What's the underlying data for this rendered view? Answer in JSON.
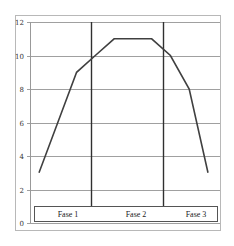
{
  "chart_data": {
    "type": "line",
    "title": "",
    "xlabel": "",
    "ylabel": "",
    "ylim": [
      0,
      12
    ],
    "yticks": [
      0,
      2,
      4,
      6,
      8,
      10,
      12
    ],
    "grid": "horizontal",
    "x": [
      1,
      2,
      3,
      4,
      5,
      6,
      7,
      8,
      9,
      10
    ],
    "series": [
      {
        "name": "curve",
        "values": [
          3,
          6,
          9,
          10,
          11,
          11,
          11,
          10,
          8,
          3
        ]
      }
    ],
    "phase_dividers": [
      4,
      7.8
    ],
    "phases": [
      {
        "label": "Fase 1"
      },
      {
        "label": "Fase 2"
      },
      {
        "label": "Fase 3"
      }
    ],
    "legend_position": "bottom"
  },
  "colors": {
    "line": "#404040",
    "grid": "#a0a0a0",
    "frame": "#b0b0b0",
    "divider": "#303030"
  }
}
